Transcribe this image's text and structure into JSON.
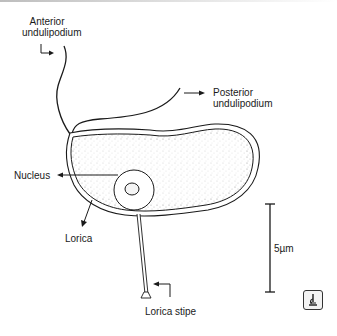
{
  "diagram": {
    "labels": {
      "anterior_line1": "Anterior",
      "anterior_line2": "undulipodium",
      "posterior_line1": "Posterior",
      "posterior_line2": "undulipodium",
      "nucleus": "Nucleus",
      "lorica": "Lorica",
      "lorica_stipe": "Lorica stipe",
      "scale": "5µm"
    },
    "icons": {
      "microscope": "microscope-icon"
    },
    "colors": {
      "line": "#1a1a1a",
      "stipple": "#9a9a9a",
      "background": "#ffffff"
    }
  }
}
